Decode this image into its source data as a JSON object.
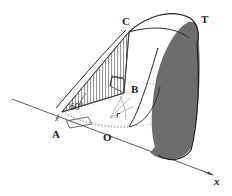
{
  "figure": {
    "background_color": "#ffffff",
    "stroke_color": "#1a1a1a",
    "shade_color": "#6b6b6b",
    "hatch_color": "#555555",
    "dotted_color": "#9a9a9a",
    "labels": {
      "point_a": "A",
      "point_b": "B",
      "point_c": "C",
      "point_o": "O",
      "point_t": "T",
      "angle_at_a": "60°",
      "radius": "r",
      "axis_x": "x",
      "tick_x": "x"
    },
    "icons": {
      "axis_arrow": "arrow-right-icon",
      "right_angle_b": "right-angle-marker-icon",
      "right_angle_a": "right-angle-marker-icon"
    },
    "geometry": {
      "base_ellipse_center": [
        124,
        104
      ],
      "base_ellipse_rx": 64,
      "base_ellipse_ry": 22,
      "point_a": [
        62,
        112
      ],
      "point_b": [
        124,
        93
      ],
      "point_c": [
        129,
        32
      ],
      "point_o": [
        110,
        122
      ],
      "point_t": [
        197,
        26
      ],
      "axis_line_start": [
        12,
        99
      ],
      "axis_line_end": [
        214,
        176
      ],
      "apex_curve_top": [
        168,
        14
      ]
    },
    "regions": {
      "hatched": "triangle-ABC-vertical-hatch",
      "shaded": "right-crescent-dark-fill"
    }
  }
}
